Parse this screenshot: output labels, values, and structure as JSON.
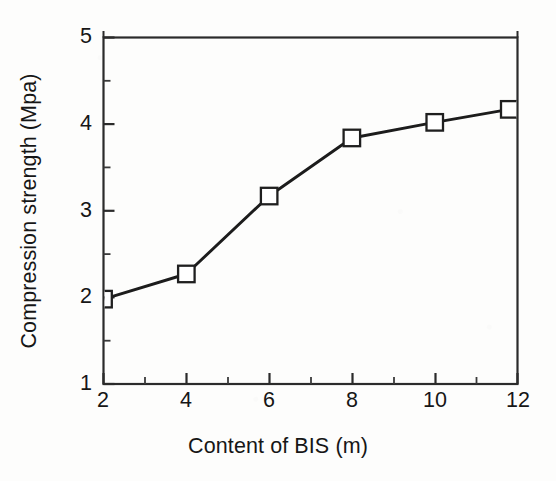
{
  "chart_data": {
    "type": "line",
    "title": "",
    "xlabel": "Content of BIS (m)",
    "ylabel": "Compression strength (Mpa)",
    "xlim": [
      2,
      12
    ],
    "ylim": [
      1,
      5
    ],
    "xticks": [
      2,
      4,
      6,
      8,
      10,
      12
    ],
    "yticks": [
      1,
      2,
      3,
      4,
      5
    ],
    "xtick_labels": [
      "2",
      "4",
      "6",
      "8",
      "10",
      "12"
    ],
    "ytick_labels": [
      "1",
      "2",
      "3",
      "4",
      "5"
    ],
    "x_minor_ticks": [
      3,
      5,
      7,
      9,
      11
    ],
    "y_minor_ticks": [
      1.5,
      2.5,
      3.5,
      4.5
    ],
    "grid": false,
    "legend": "none",
    "marker": "open-square",
    "line_color": "#1a1a1a",
    "marker_face_color": "#ffffff",
    "marker_edge_color": "#1a1a1a",
    "x": [
      2,
      4,
      6,
      8,
      10,
      11.8
    ],
    "values": [
      1.98,
      2.27,
      3.17,
      3.84,
      4.02,
      4.17
    ],
    "series": [
      {
        "name": "Compression strength",
        "x": [
          2,
          4,
          6,
          8,
          10,
          11.8
        ],
        "values": [
          1.98,
          2.27,
          3.17,
          3.84,
          4.02,
          4.17
        ]
      }
    ],
    "annotations": []
  },
  "axes": {
    "x_title": "Content of BIS (m)",
    "y_title": "Compression strength (Mpa)"
  },
  "ticks": {
    "y": [
      "5",
      "4",
      "3",
      "2",
      "1"
    ],
    "x": [
      "2",
      "4",
      "6",
      "8",
      "10",
      "12"
    ]
  }
}
